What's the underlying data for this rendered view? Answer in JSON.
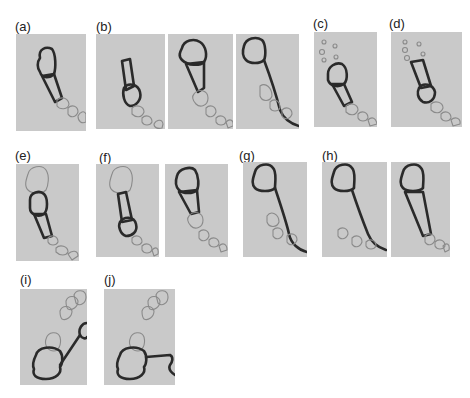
{
  "figure": {
    "panel_labels": {
      "a": "(a)",
      "b": "(b)",
      "c": "(c)",
      "d": "(d)",
      "e": "(e)",
      "f": "(f)",
      "g": "(g)",
      "h": "(h)",
      "i": "(i)",
      "j": "(j)"
    },
    "rows": [
      {
        "row": 1,
        "panels": [
          "a",
          "b",
          "c",
          "d"
        ],
        "subframes": {
          "a": 1,
          "b": 3,
          "c": 1,
          "d": 1
        }
      },
      {
        "row": 2,
        "panels": [
          "e",
          "f",
          "g",
          "h"
        ],
        "subframes": {
          "e": 1,
          "f": 2,
          "g": 1,
          "h": 2
        }
      },
      {
        "row": 3,
        "panels": [
          "i",
          "j"
        ],
        "subframes": {
          "i": 1,
          "j": 1
        }
      }
    ],
    "colors": {
      "panel_background": "#c9c9c9",
      "highlight_stroke": "#2a2a2a",
      "outline_stroke": "#8a8a8a"
    }
  }
}
